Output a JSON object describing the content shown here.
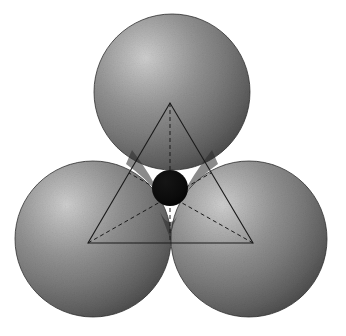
{
  "figure": {
    "title": "Trigonal interstitial site between three close-packed spheres",
    "background_color": "#ffffff",
    "width": 346,
    "height": 336
  },
  "palette": {
    "sphere_highlight": "#c8c8c8",
    "sphere_mid": "#8a8a8a",
    "sphere_shadow": "#4a4a4a",
    "sphere_edge": "#3a3a3a",
    "interstitial_fill": "#080808",
    "line_color": "#1a1a1a",
    "background": "#ffffff"
  },
  "spheres": [
    {
      "id": "sphere-top",
      "label": "top sphere",
      "cx": 172,
      "cy": 92,
      "r": 78,
      "highlight_x": 140,
      "highlight_y": 56
    },
    {
      "id": "sphere-bottom-left",
      "label": "bottom left sphere",
      "cx": 93,
      "cy": 239,
      "r": 78,
      "highlight_x": 61,
      "highlight_y": 203
    },
    {
      "id": "sphere-bottom-right",
      "label": "bottom right sphere",
      "cx": 249,
      "cy": 239,
      "r": 78,
      "highlight_x": 217,
      "highlight_y": 203
    }
  ],
  "interstitial": {
    "id": "interstitial-sphere",
    "label": "interstitial atom",
    "cx": 170,
    "cy": 188,
    "r": 18,
    "fill": "#080808"
  },
  "triangle": {
    "label": "centers triangle",
    "stroke_width": 1.1,
    "vertices": [
      {
        "name": "top-vertex",
        "x": 170,
        "y": 103
      },
      {
        "name": "bottom-left-vertex",
        "x": 88,
        "y": 243
      },
      {
        "name": "bottom-right-vertex",
        "x": 253,
        "y": 243
      }
    ]
  },
  "dashed_lines": {
    "label": "medians to interstitial center",
    "dash_pattern": "4 3",
    "stroke_width": 1.0,
    "segments": [
      {
        "name": "median-from-top",
        "x1": 170,
        "y1": 103,
        "x2": 170,
        "y2": 243
      },
      {
        "name": "median-from-bottom-left",
        "x1": 88,
        "y1": 243,
        "x2": 211,
        "y2": 173
      },
      {
        "name": "median-from-bottom-right",
        "x1": 253,
        "y1": 243,
        "x2": 129,
        "y2": 173
      }
    ]
  },
  "chart_data": {
    "type": "diagram",
    "title": "Trigonal interstitial site between three close-packed spheres",
    "elements": [
      {
        "name": "top sphere",
        "kind": "sphere",
        "center": [
          172,
          92
        ],
        "radius": 78,
        "color": "#8a8a8a"
      },
      {
        "name": "bottom left sphere",
        "kind": "sphere",
        "center": [
          93,
          239
        ],
        "radius": 78,
        "color": "#8a8a8a"
      },
      {
        "name": "bottom right sphere",
        "kind": "sphere",
        "center": [
          249,
          239
        ],
        "radius": 78,
        "color": "#8a8a8a"
      },
      {
        "name": "interstitial sphere",
        "kind": "sphere",
        "center": [
          170,
          188
        ],
        "radius": 18,
        "color": "#080808"
      },
      {
        "name": "centers triangle",
        "kind": "polygon",
        "points": [
          [
            170,
            103
          ],
          [
            88,
            243
          ],
          [
            253,
            243
          ]
        ],
        "style": "solid"
      },
      {
        "name": "medians",
        "kind": "lines",
        "style": "dashed",
        "count": 3
      }
    ],
    "labels": [],
    "legend": []
  }
}
